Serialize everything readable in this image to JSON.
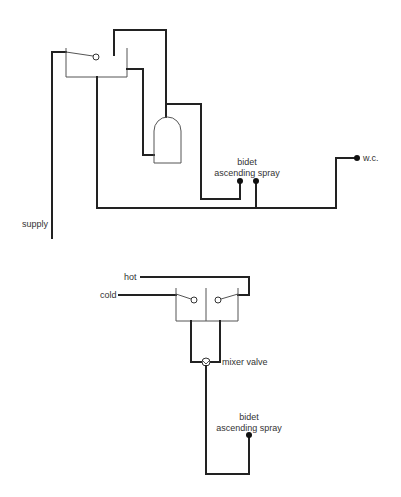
{
  "diagram": {
    "top": {
      "labels": {
        "supply": "supply",
        "bidet_line1": "bidet",
        "bidet_line2": "ascending spray",
        "wc": "w.c."
      }
    },
    "bottom": {
      "labels": {
        "hot": "hot",
        "cold": "cold",
        "mixer_valve": "mixer valve",
        "bidet_line1": "bidet",
        "bidet_line2": "ascending spray"
      }
    }
  }
}
